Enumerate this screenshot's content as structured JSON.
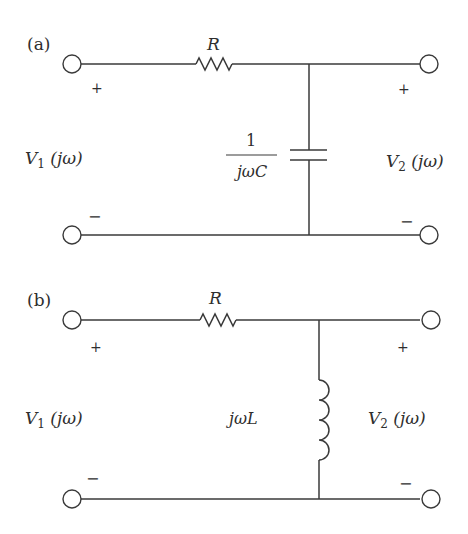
{
  "diagram": {
    "type": "circuit-schematic",
    "stroke_color": "#3a3a3a",
    "text_color": "#2e2e2e",
    "circuits": [
      {
        "id": "a",
        "label": "(a)",
        "resistor_label": "R",
        "shunt_element": "capacitor",
        "shunt_impedance": {
          "numerator": "1",
          "denominator": "jωC"
        },
        "input": {
          "plus": "+",
          "minus": "−",
          "voltage": "V",
          "voltage_sub": "1",
          "voltage_arg": " (jω)"
        },
        "output": {
          "plus": "+",
          "minus": "−",
          "voltage": "V",
          "voltage_sub": "2",
          "voltage_arg": " (jω)"
        }
      },
      {
        "id": "b",
        "label": "(b)",
        "resistor_label": "R",
        "shunt_element": "inductor",
        "shunt_impedance": {
          "text": "jωL"
        },
        "input": {
          "plus": "+",
          "minus": "−",
          "voltage": "V",
          "voltage_sub": "1",
          "voltage_arg": " (jω)"
        },
        "output": {
          "plus": "+",
          "minus": "−",
          "voltage": "V",
          "voltage_sub": "2",
          "voltage_arg": " (jω)"
        }
      }
    ]
  }
}
